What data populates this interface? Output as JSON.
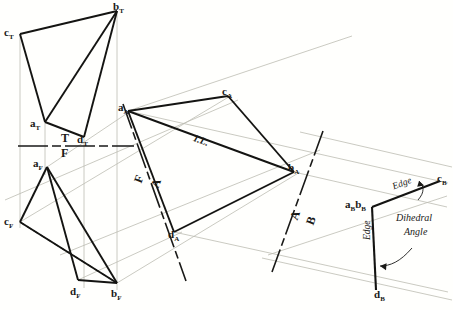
{
  "figure": {
    "background": "#fffffd",
    "ink": "#1a1a18",
    "construction_color": "#b9b9b0"
  },
  "views": {
    "top": {
      "name": "Top view",
      "points": {
        "a": {
          "label": "a",
          "sub": "T",
          "x": 45,
          "y": 122
        },
        "b": {
          "label": "b",
          "sub": "T",
          "x": 117,
          "y": 11
        },
        "c": {
          "label": "c",
          "sub": "T",
          "x": 20,
          "y": 34
        },
        "d": {
          "label": "d",
          "sub": "T",
          "x": 84,
          "y": 137
        }
      }
    },
    "front": {
      "name": "Front view",
      "points": {
        "a": {
          "label": "a",
          "sub": "F",
          "x": 47,
          "y": 167
        },
        "b": {
          "label": "b",
          "sub": "F",
          "x": 117,
          "y": 283
        },
        "c": {
          "label": "c",
          "sub": "F",
          "x": 20,
          "y": 222
        },
        "d": {
          "label": "d",
          "sub": "F",
          "x": 78,
          "y": 280
        }
      }
    },
    "auxiliary_a": {
      "name": "Auxiliary view A",
      "points": {
        "a": {
          "label": "a",
          "sub": "A",
          "x": 128,
          "y": 111
        },
        "b": {
          "label": "b",
          "sub": "A",
          "x": 294,
          "y": 172
        },
        "c": {
          "label": "c",
          "sub": "A",
          "x": 228,
          "y": 96
        },
        "d": {
          "label": "d",
          "sub": "A",
          "x": 174,
          "y": 232
        }
      }
    },
    "auxiliary_b": {
      "name": "Auxiliary view B (edge view)",
      "points": {
        "ab": {
          "label": "a",
          "sub": "B",
          "label2": "b",
          "sub2": "B",
          "x": 372,
          "y": 207
        },
        "c": {
          "label": "c",
          "sub": "B",
          "x": 440,
          "y": 181
        },
        "d": {
          "label": "d",
          "sub": "B",
          "x": 376,
          "y": 290
        }
      }
    }
  },
  "fold_lines": [
    {
      "name": "T/F",
      "upper": "T",
      "lower": "F",
      "orientation": "horizontal",
      "y": 146
    },
    {
      "name": "F/A",
      "upper": "F",
      "lower": "A",
      "orientation": "oblique"
    },
    {
      "name": "A/B",
      "upper": "A",
      "lower": "B",
      "orientation": "oblique"
    }
  ],
  "annotations": {
    "true_length": "T.L.",
    "edge_top": "Edge",
    "edge_side": "Edge",
    "dihedral_line1": "Dihedral",
    "dihedral_line2": "Angle"
  }
}
